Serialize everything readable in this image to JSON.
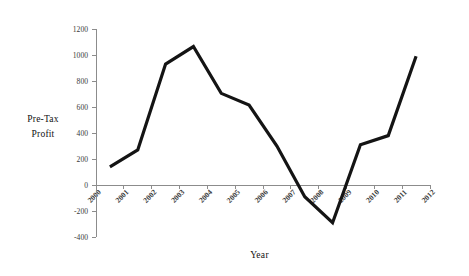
{
  "chart_data": {
    "type": "line",
    "title": "",
    "xlabel": "Year",
    "ylabel": "Pre-Tax Profit",
    "ylabel_lines": [
      "Pre-Tax",
      "Profit"
    ],
    "x": [
      2000,
      2001,
      2002,
      2003,
      2004,
      2005,
      2006,
      2007,
      2008,
      2009,
      2010,
      2011
    ],
    "values": [
      140,
      270,
      930,
      1065,
      705,
      615,
      300,
      -90,
      -290,
      310,
      380,
      990
    ],
    "series": [
      {
        "name": "Pre-Tax Profit",
        "values": [
          140,
          270,
          930,
          1065,
          705,
          615,
          300,
          -90,
          -290,
          310,
          380,
          990
        ]
      }
    ],
    "xlim": [
      2000,
      2012
    ],
    "ylim": [
      -400,
      1200
    ],
    "y_ticks": [
      -400,
      -200,
      0,
      200,
      400,
      600,
      800,
      1000,
      1200
    ],
    "y_tick_labels": [
      "-400",
      "-200",
      "0",
      "200",
      "400",
      "600",
      "800",
      "1000",
      "1200"
    ],
    "x_ticks": [
      2000,
      2001,
      2002,
      2003,
      2004,
      2005,
      2006,
      2007,
      2008,
      2009,
      2010,
      2011,
      2012
    ],
    "x_tick_labels": [
      "2000",
      "2001",
      "2002",
      "2003",
      "2004",
      "2005",
      "2006",
      "2007",
      "2008",
      "2009",
      "2010",
      "2011",
      "2012"
    ],
    "x_tick_rotation": -45,
    "grid": false,
    "legend": false,
    "legend_position": "none",
    "line_color": "#141414",
    "axis_color": "#8c8c8c",
    "background_color": "#ffffff",
    "points_at_tick_midpoints": true
  },
  "axes": {
    "y_title_line1": "Pre-Tax",
    "y_title_line2": "Profit",
    "x_title": "Year"
  }
}
